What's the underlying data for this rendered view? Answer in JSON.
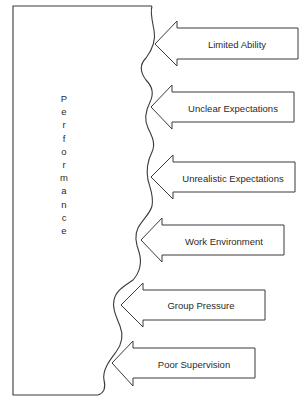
{
  "diagram": {
    "central_label": "Performance",
    "central_letters": [
      "P",
      "e",
      "r",
      "f",
      "o",
      "r",
      "m",
      "a",
      "n",
      "c",
      "e"
    ],
    "factors": [
      {
        "label": "Limited Ability"
      },
      {
        "label": "Unclear Expectations"
      },
      {
        "label": "Unrealistic Expectations"
      },
      {
        "label": "Work Environment"
      },
      {
        "label": "Group Pressure"
      },
      {
        "label": "Poor Supervision"
      }
    ],
    "colors": {
      "stroke": "#3a3a3a",
      "background": "#ffffff",
      "text": "#2a2a2a"
    }
  }
}
